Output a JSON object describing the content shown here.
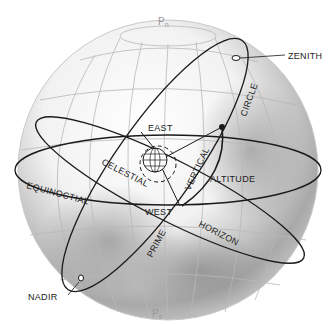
{
  "diagram": {
    "labels": {
      "pole_north": "P",
      "pole_north_sub": "n",
      "pole_south": "P",
      "pole_south_sub": "s",
      "zenith": "ZENITH",
      "nadir": "NADIR",
      "east": "EAST",
      "west": "WEST",
      "circle": "CIRCLE",
      "vertical": "VERTICAL",
      "altitude": "ALTITUDE",
      "celestial": "CELESTIAL",
      "equinoctial": "EQUINOCTIAL",
      "prime": "PRIME",
      "horizon": "HORIZON"
    },
    "colors": {
      "sphere_light": "#ffffff",
      "sphere_dark": "#8a8a8a",
      "grid": "#b8b8b8",
      "lines": "#1a1a1a"
    }
  }
}
